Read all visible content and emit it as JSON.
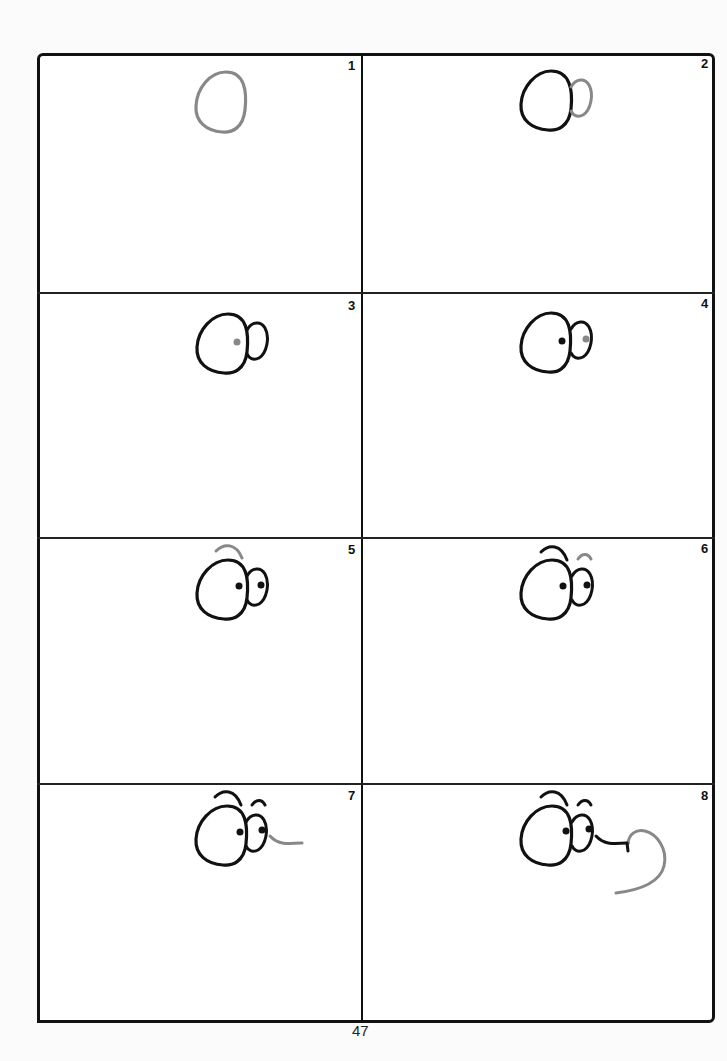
{
  "page": {
    "page_number": "47",
    "ink_color": "#111111",
    "highlight_color": "#888888"
  },
  "panels": [
    {
      "step": "1",
      "description": "Draw an egg-shaped oval for the first eye"
    },
    {
      "step": "2",
      "description": "Add a smaller oval overlapping on the right for the second eye"
    },
    {
      "step": "3",
      "description": "Draw a pupil inside the first eye"
    },
    {
      "step": "4",
      "description": "Draw a pupil inside the second eye"
    },
    {
      "step": "5",
      "description": "Add an eyebrow arc above the first eye"
    },
    {
      "step": "6",
      "description": "Add an eyebrow arc above the second eye"
    },
    {
      "step": "7",
      "description": "Draw a line extending right from the second eye"
    },
    {
      "step": "8",
      "description": "Curl the line around into a large hook shape"
    }
  ]
}
